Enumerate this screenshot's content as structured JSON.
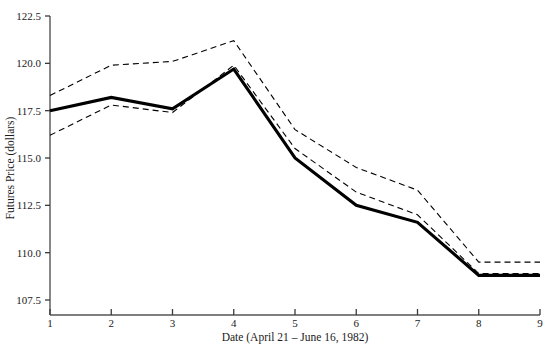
{
  "chart_data": {
    "type": "line",
    "title": "",
    "xlabel": "Date (April 21 – June 16, 1982)",
    "ylabel": "Futures Price (dollars)",
    "x": [
      1,
      2,
      3,
      4,
      5,
      6,
      7,
      8,
      9
    ],
    "xticklabels": [
      "1",
      "2",
      "3",
      "4",
      "5",
      "6",
      "7",
      "8",
      "9"
    ],
    "yticklabels": [
      "107.5",
      "110.0",
      "112.5",
      "115.0",
      "117.5",
      "120.0",
      "122.5"
    ],
    "yticks": [
      107.5,
      110.0,
      112.5,
      115.0,
      117.5,
      120.0,
      122.5
    ],
    "xlim": [
      1,
      9
    ],
    "ylim": [
      107.5,
      122.5
    ],
    "grid": false,
    "legend": "none",
    "series": [
      {
        "name": "Futures price",
        "style": "solid",
        "color": "#000000",
        "width": 3.1,
        "values": [
          117.5,
          118.2,
          117.6,
          119.7,
          115.0,
          112.5,
          111.6,
          108.8,
          108.8
        ]
      },
      {
        "name": "Upper band",
        "style": "dashed",
        "color": "#000000",
        "width": 1.1,
        "values": [
          118.3,
          119.9,
          120.1,
          121.2,
          116.5,
          114.5,
          113.3,
          109.5,
          109.5
        ]
      },
      {
        "name": "Lower band",
        "style": "dashed",
        "color": "#000000",
        "width": 1.1,
        "values": [
          116.2,
          117.8,
          117.4,
          119.9,
          115.5,
          113.2,
          112.0,
          108.9,
          108.9
        ]
      }
    ]
  },
  "axes": {
    "tick_color": "#3a3a3a",
    "axis_color": "#555555"
  }
}
